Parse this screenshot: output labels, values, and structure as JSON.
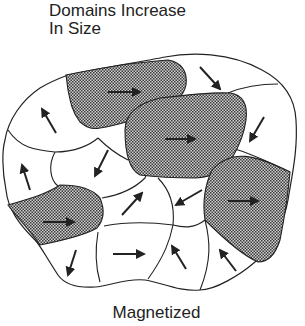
{
  "title": {
    "line1": "Domains Increase",
    "line2": "In Size"
  },
  "caption": "Magnetized",
  "colors": {
    "stroke": "#222222",
    "stipple_dark": "#3a3a3a",
    "stipple_light": "#cfcfcf",
    "background": "#ffffff"
  },
  "domains": [
    {
      "id": "top-left-shaded",
      "shaded": true,
      "arrow": "right"
    },
    {
      "id": "top-right-unshaded",
      "shaded": false,
      "arrow": "down-right"
    },
    {
      "id": "center-top-shaded",
      "shaded": true,
      "arrow": "right"
    },
    {
      "id": "right-unshaded",
      "shaded": false,
      "arrow": "down-left"
    },
    {
      "id": "upper-left-unshaded",
      "shaded": false,
      "arrow": "up-left"
    },
    {
      "id": "left-unshaded",
      "shaded": false,
      "arrow": "up-left"
    },
    {
      "id": "center-left-unshaded",
      "shaded": false,
      "arrow": "down-left"
    },
    {
      "id": "left-lower-shaded",
      "shaded": true,
      "arrow": "right"
    },
    {
      "id": "center-unshaded",
      "shaded": false,
      "arrow": "up-right"
    },
    {
      "id": "center-right-unshaded",
      "shaded": false,
      "arrow": "down-left"
    },
    {
      "id": "right-lower-shaded",
      "shaded": true,
      "arrow": "right"
    },
    {
      "id": "bottom-left-unshaded",
      "shaded": false,
      "arrow": "down-left"
    },
    {
      "id": "bottom-center-unshaded",
      "shaded": false,
      "arrow": "right"
    },
    {
      "id": "bottom-center-right-unshaded",
      "shaded": false,
      "arrow": "up-left"
    },
    {
      "id": "bottom-right-unshaded",
      "shaded": false,
      "arrow": "up-left"
    }
  ]
}
